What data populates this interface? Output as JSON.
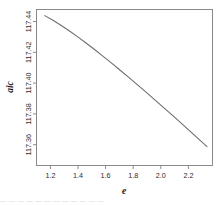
{
  "figure": {
    "background_color": "#ffffff",
    "frame_color": "#8a8a8a",
    "line_color": "#6e6e6e"
  },
  "bottom_artifact": {
    "text": "— —  — — — — —  — — — — —"
  },
  "chart_data": {
    "type": "line",
    "title": "",
    "xlabel": "e",
    "ylabel": "aic",
    "grid": false,
    "legend": null,
    "xlim": [
      1.1,
      2.38
    ],
    "ylim": [
      117.325,
      117.452
    ],
    "xticks": [
      1.2,
      1.4,
      1.6,
      1.8,
      2.0,
      2.2
    ],
    "xtick_labels": [
      "1.2",
      "1.4",
      "1.6",
      "1.8",
      "2.0",
      "2.2"
    ],
    "yticks": [
      117.36,
      117.38,
      117.4,
      117.42,
      117.44
    ],
    "ytick_labels": [
      "117.36",
      "117.38",
      "117.40",
      "117.42",
      "117.44"
    ],
    "ytick_label_rotation": 90,
    "series": [
      {
        "name": "aic",
        "x": [
          1.16,
          1.22,
          1.28,
          1.34,
          1.4,
          1.46,
          1.52,
          1.58,
          1.64,
          1.7,
          1.76,
          1.82,
          1.88,
          1.94,
          2.0,
          2.06,
          2.12,
          2.18,
          2.24,
          2.3,
          2.34
        ],
        "y": [
          117.447,
          117.4432,
          117.439,
          117.4345,
          117.4297,
          117.4247,
          117.4196,
          117.4143,
          117.4089,
          117.4034,
          117.3978,
          117.3921,
          117.3863,
          117.3805,
          117.3746,
          117.3687,
          117.3627,
          117.3567,
          117.3506,
          117.3445,
          117.3404
        ]
      }
    ]
  }
}
